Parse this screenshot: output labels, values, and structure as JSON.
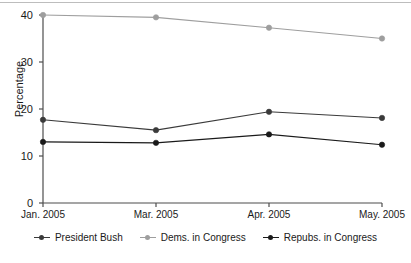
{
  "chart_data": {
    "type": "line",
    "title": "",
    "xlabel": "",
    "ylabel": "Percentage",
    "categories": [
      "Jan. 2005",
      "Mar. 2005",
      "Apr. 2005",
      "May. 2005"
    ],
    "ylim": [
      0,
      40
    ],
    "yticks": [
      0,
      10,
      20,
      30,
      40
    ],
    "grid": false,
    "legend_position": "bottom",
    "series": [
      {
        "name": "President Bush",
        "values": [
          17.7,
          15.5,
          19.4,
          18.1
        ],
        "color": "#3a3a3a",
        "marker": "circle"
      },
      {
        "name": "Dems. in Congress",
        "values": [
          40.0,
          39.5,
          37.3,
          35.0
        ],
        "color": "#9e9e9e",
        "marker": "circle"
      },
      {
        "name": "Repubs. in Congress",
        "values": [
          13.0,
          12.8,
          14.6,
          12.4
        ],
        "color": "#1a1a1a",
        "marker": "circle"
      }
    ]
  },
  "axis": {
    "y_title": "Percentage",
    "y_tick_labels": [
      "0",
      "10",
      "20",
      "30",
      "40"
    ],
    "x_tick_labels": [
      "Jan. 2005",
      "Mar. 2005",
      "Apr. 2005",
      "May. 2005"
    ],
    "axis_color": "#4d4d4d"
  },
  "legend": {
    "items": [
      {
        "label": "President Bush",
        "color": "#3a3a3a"
      },
      {
        "label": "Dems. in Congress",
        "color": "#9e9e9e"
      },
      {
        "label": "Repubs. in Congress",
        "color": "#1a1a1a"
      }
    ]
  }
}
